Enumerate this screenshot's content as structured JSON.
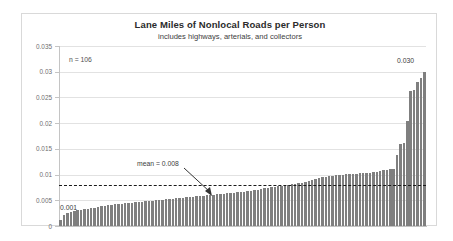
{
  "chart_data": {
    "type": "bar",
    "title": "Lane Miles of Nonlocal Roads per Person",
    "subtitle": "includes highways, arterials, and collectors",
    "xlabel": "",
    "ylabel": "",
    "ylim": [
      0,
      0.035
    ],
    "ytick_labels": [
      "0.035",
      "0.03",
      "0.025",
      "0.02",
      "0.015",
      "0.01",
      "0.005",
      "0"
    ],
    "ytick_values": [
      0.035,
      0.03,
      0.025,
      0.02,
      0.015,
      0.01,
      0.005,
      0
    ],
    "grid": true,
    "legend": "none",
    "n": 106,
    "n_label": "n = 106",
    "mean": 0.008,
    "mean_label": "mean = 0.008",
    "min_label": "0.001",
    "max_label": "0.030",
    "bar_color": "#7f7f7f",
    "categories_visible": false,
    "values": [
      0.0012,
      0.0022,
      0.0026,
      0.0028,
      0.003,
      0.0031,
      0.0032,
      0.0033,
      0.0034,
      0.0035,
      0.0036,
      0.0037,
      0.0038,
      0.0039,
      0.004,
      0.0041,
      0.0042,
      0.0042,
      0.0043,
      0.0044,
      0.0044,
      0.0045,
      0.0046,
      0.0046,
      0.0047,
      0.0048,
      0.0048,
      0.0049,
      0.005,
      0.005,
      0.0051,
      0.0052,
      0.0052,
      0.0053,
      0.0054,
      0.0054,
      0.0055,
      0.0056,
      0.0056,
      0.0057,
      0.0058,
      0.0058,
      0.0059,
      0.006,
      0.006,
      0.0061,
      0.0062,
      0.0062,
      0.0063,
      0.0064,
      0.0064,
      0.0065,
      0.0066,
      0.0066,
      0.0067,
      0.0068,
      0.0069,
      0.007,
      0.0071,
      0.0072,
      0.0073,
      0.0074,
      0.0075,
      0.0076,
      0.0077,
      0.0078,
      0.0079,
      0.008,
      0.0081,
      0.0082,
      0.0083,
      0.0084,
      0.0086,
      0.0088,
      0.009,
      0.0092,
      0.0094,
      0.0095,
      0.0096,
      0.0097,
      0.0098,
      0.0099,
      0.01,
      0.01,
      0.0101,
      0.0101,
      0.0102,
      0.0102,
      0.0103,
      0.0103,
      0.0104,
      0.0104,
      0.0105,
      0.0106,
      0.0107,
      0.0108,
      0.0109,
      0.011,
      0.0111,
      0.0138,
      0.016,
      0.0161,
      0.0205,
      0.0263,
      0.0264,
      0.028,
      0.0288,
      0.03
    ]
  }
}
